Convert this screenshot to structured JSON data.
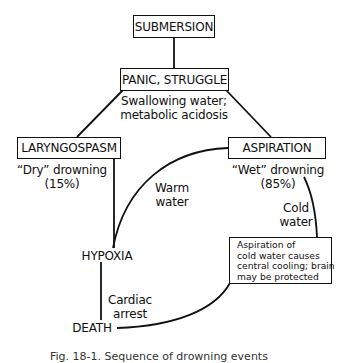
{
  "nodes": {
    "submersion": "SUBMERSION",
    "panic": "PANIC, STRUGGLE",
    "laryngospasm": "LARYNGOSPASM",
    "aspiration": "ASPIRATION",
    "hypoxia": "HYPOXIA",
    "death": "DEATH"
  },
  "labels": {
    "swallowing_line1": "Swallowing water;",
    "swallowing_line2": "metabolic acidosis",
    "dry_line1": "“Dry” drowning",
    "dry_line2": "(15%)",
    "wet_line1": "“Wet” drowning",
    "wet_line2": "(85%)",
    "warm_line1": "Warm",
    "warm_line2": "water",
    "cold_line1": "Cold",
    "cold_line2": "water",
    "cardiac_line1": "Cardiac",
    "cardiac_line2": "arrest"
  },
  "note": {
    "lines": [
      "Aspiration of",
      "cold water causes",
      "central cooling; brain",
      "may be protected"
    ]
  },
  "caption": "Fig. 18-1. Sequence of drowning events"
}
